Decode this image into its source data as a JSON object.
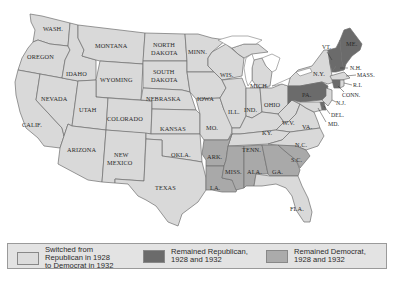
{
  "map": {
    "title": "Presidential Election Results, 1928 and 1932",
    "colors": {
      "switched": "#d9d9d9",
      "remained_republican": "#6b6b6b",
      "remained_democrat": "#a9a9a9",
      "border": "#6e6e6e"
    },
    "states": {
      "wash": {
        "label": "WASH.",
        "category": "switched"
      },
      "oregon": {
        "label": "OREGON",
        "category": "switched"
      },
      "calif": {
        "label": "CALIF.",
        "category": "switched"
      },
      "idaho": {
        "label": "IDAHO",
        "category": "switched"
      },
      "nevada": {
        "label": "NEVADA",
        "category": "switched"
      },
      "montana": {
        "label": "MONTANA",
        "category": "switched"
      },
      "wyoming": {
        "label": "WYOMING",
        "category": "switched"
      },
      "utah": {
        "label": "UTAH",
        "category": "switched"
      },
      "colorado": {
        "label": "COLORADO",
        "category": "switched"
      },
      "arizona": {
        "label": "ARIZONA",
        "category": "switched"
      },
      "new_mexico_1": {
        "label": "NEW",
        "category": "switched"
      },
      "new_mexico_2": {
        "label": "MEXICO",
        "category": "switched"
      },
      "north_dakota_1": {
        "label": "NORTH",
        "category": "switched"
      },
      "north_dakota_2": {
        "label": "DAKOTA",
        "category": "switched"
      },
      "south_dakota_1": {
        "label": "SOUTH",
        "category": "switched"
      },
      "south_dakota_2": {
        "label": "DAKOTA",
        "category": "switched"
      },
      "nebraska": {
        "label": "NEBRASKA",
        "category": "switched"
      },
      "kansas": {
        "label": "KANSAS",
        "category": "switched"
      },
      "okla": {
        "label": "OKLA.",
        "category": "switched"
      },
      "texas": {
        "label": "TEXAS",
        "category": "switched"
      },
      "minn": {
        "label": "MINN.",
        "category": "switched"
      },
      "iowa": {
        "label": "IOWA",
        "category": "switched"
      },
      "mo": {
        "label": "MO.",
        "category": "switched"
      },
      "wis": {
        "label": "WIS.",
        "category": "switched"
      },
      "ill": {
        "label": "ILL.",
        "category": "switched"
      },
      "mich": {
        "label": "MICH.",
        "category": "switched"
      },
      "ind": {
        "label": "IND.",
        "category": "switched"
      },
      "ohio": {
        "label": "OHIO",
        "category": "switched"
      },
      "ky": {
        "label": "KY.",
        "category": "switched"
      },
      "tenn": {
        "label": "TENN.",
        "category": "switched"
      },
      "wv": {
        "label": "W.V.",
        "category": "switched"
      },
      "va": {
        "label": "VA.",
        "category": "switched"
      },
      "nc": {
        "label": "N.C.",
        "category": "switched"
      },
      "fla": {
        "label": "FLA.",
        "category": "switched"
      },
      "ny": {
        "label": "N.Y.",
        "category": "switched"
      },
      "mass": {
        "label": "MASS.",
        "category": "switched"
      },
      "ri": {
        "label": "R.I.",
        "category": "switched"
      },
      "nj": {
        "label": "N.J.",
        "category": "switched"
      },
      "md": {
        "label": "MD.",
        "category": "switched"
      },
      "ark": {
        "label": "ARK.",
        "category": "remained_democrat"
      },
      "la": {
        "label": "LA.",
        "category": "remained_democrat"
      },
      "miss": {
        "label": "MISS.",
        "category": "remained_democrat"
      },
      "ala": {
        "label": "ALA.",
        "category": "remained_democrat"
      },
      "ga": {
        "label": "GA.",
        "category": "remained_democrat"
      },
      "sc": {
        "label": "S.C.",
        "category": "remained_democrat"
      },
      "me": {
        "label": "ME.",
        "category": "remained_republican"
      },
      "vt": {
        "label": "VT.",
        "category": "remained_republican"
      },
      "nh": {
        "label": "N.H.",
        "category": "remained_republican"
      },
      "pa": {
        "label": "PA.",
        "category": "remained_republican"
      },
      "conn": {
        "label": "CONN.",
        "category": "remained_republican"
      },
      "del": {
        "label": "DEL.",
        "category": "remained_republican"
      }
    }
  },
  "legend": {
    "items": [
      {
        "key": "switched",
        "lines": [
          "Switched from",
          "Republican in 1928",
          "to Democrat in 1932"
        ]
      },
      {
        "key": "remained_republican",
        "lines": [
          "Remained Republican,",
          "1928 and 1932"
        ]
      },
      {
        "key": "remained_democrat",
        "lines": [
          "Remained Democrat,",
          "1928 and 1932"
        ]
      }
    ]
  }
}
